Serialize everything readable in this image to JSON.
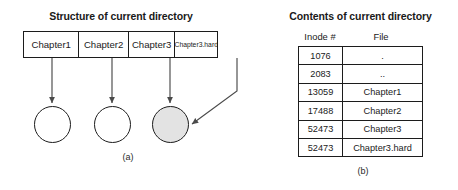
{
  "figure": {
    "panel_a": {
      "title": "Structure of current directory",
      "caption": "(a)",
      "directory_entries": [
        {
          "label": "Chapter1"
        },
        {
          "label": "Chapter2"
        },
        {
          "label": "Chapter3"
        },
        {
          "label": "Chapter3.hard"
        }
      ],
      "inodes": [
        {
          "name": "inode-circle-chapter1",
          "shaded": false
        },
        {
          "name": "inode-circle-chapter2",
          "shaded": false
        },
        {
          "name": "inode-circle-chapter3-shared",
          "shaded": true
        }
      ],
      "pointer_note": "Chapter3 and Chapter3.hard both point to the shaded inode"
    },
    "panel_b": {
      "title": "Contents of current directory",
      "caption": "(b)",
      "columns": [
        "Inode #",
        "File"
      ],
      "rows": [
        {
          "inode": "1076",
          "file": "."
        },
        {
          "inode": "2083",
          "file": ".."
        },
        {
          "inode": "13059",
          "file": "Chapter1"
        },
        {
          "inode": "17488",
          "file": "Chapter2"
        },
        {
          "inode": "52473",
          "file": "Chapter3"
        },
        {
          "inode": "52473",
          "file": "Chapter3.hard"
        }
      ]
    }
  },
  "colors": {
    "ink": "#1c1c1c",
    "shaded_fill": "#e3e3e3",
    "background": "#ffffff"
  }
}
